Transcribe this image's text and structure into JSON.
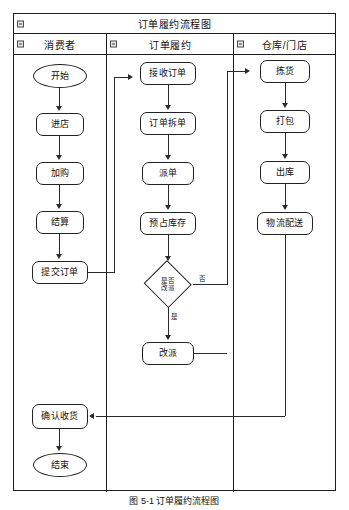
{
  "figure": {
    "title": "订单履约流程图",
    "caption": "图 5-1  订单履约流程图"
  },
  "lanes": [
    {
      "id": "consumer",
      "label": "消费者",
      "icon": "collapse-minus-icon"
    },
    {
      "id": "fulfill",
      "label": "订单履约",
      "icon": "collapse-minus-icon"
    },
    {
      "id": "warehouse",
      "label": "仓库/门店",
      "icon": "collapse-minus-icon"
    }
  ],
  "nodes": {
    "start": {
      "label": "开始",
      "shape": "terminator",
      "lane": "consumer"
    },
    "enter_store": {
      "label": "进店",
      "shape": "process",
      "lane": "consumer"
    },
    "add_cart": {
      "label": "加购",
      "shape": "process",
      "lane": "consumer"
    },
    "checkout": {
      "label": "结算",
      "shape": "process",
      "lane": "consumer"
    },
    "submit_order": {
      "label": "提交订单",
      "shape": "process",
      "lane": "consumer"
    },
    "confirm_recv": {
      "label": "确认收货",
      "shape": "process",
      "lane": "consumer"
    },
    "end": {
      "label": "结束",
      "shape": "terminator",
      "lane": "consumer"
    },
    "receive_order": {
      "label": "接收订单",
      "shape": "process",
      "lane": "fulfill"
    },
    "split_order": {
      "label": "订单拆单",
      "shape": "process",
      "lane": "fulfill"
    },
    "dispatch": {
      "label": "派单",
      "shape": "process",
      "lane": "fulfill"
    },
    "reserve_stock": {
      "label": "预占库存",
      "shape": "process",
      "lane": "fulfill"
    },
    "decision": {
      "label": "是否\n改派",
      "shape": "decision",
      "lane": "fulfill"
    },
    "reassign": {
      "label": "改派",
      "shape": "process",
      "lane": "fulfill"
    },
    "pick": {
      "label": "拣货",
      "shape": "process",
      "lane": "warehouse"
    },
    "pack": {
      "label": "打包",
      "shape": "process",
      "lane": "warehouse"
    },
    "outbound": {
      "label": "出库",
      "shape": "process",
      "lane": "warehouse"
    },
    "delivery": {
      "label": "物流配送",
      "shape": "process",
      "lane": "warehouse"
    }
  },
  "edge_labels": {
    "decision_no": "否",
    "decision_yes": "是"
  },
  "colors": {
    "stroke": "#222222",
    "background": "#ffffff",
    "text": "#111111"
  }
}
